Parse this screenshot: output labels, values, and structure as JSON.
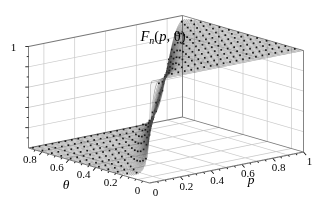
{
  "figure": {
    "background": "#ffffff",
    "kind": "3d-surface-plot"
  },
  "chart_data": {
    "type": "surface",
    "title_text": "F_n(p, θ)",
    "title_parts": {
      "func": "F",
      "sub": "n",
      "open": "(",
      "arg1": "p",
      "sep": ", ",
      "arg2": "θ",
      "close": ")"
    },
    "x_axis": {
      "label": "p",
      "range": [
        0,
        1
      ],
      "ticks": [
        0,
        0.2,
        0.4,
        0.6,
        0.8,
        1
      ],
      "tick_labels": [
        "0",
        "0.2",
        "0.4",
        "0.6",
        "0.8",
        "1"
      ],
      "minor_step": 0.05
    },
    "y_axis": {
      "label": "θ",
      "range": [
        0,
        0.9
      ],
      "ticks": [
        0,
        0.2,
        0.4,
        0.6,
        0.8
      ],
      "tick_labels": [
        "0",
        "0.2",
        "0.4",
        "0.6",
        "0.8"
      ],
      "minor_step": 0.05
    },
    "z_axis": {
      "label": "",
      "range": [
        0,
        1
      ],
      "ticks": [
        1
      ],
      "tick_labels": [
        "1"
      ],
      "minor_ticks": [
        0.2,
        0.4,
        0.6,
        0.8
      ]
    },
    "surface": {
      "description": "Distribution function F_n(p, θ): near 0 for p < θ, near 1 for p > θ, with a steep sigmoid transition along the diagonal p = θ (steeper for θ near 0); drawn as a fine mesh of constant-θ curves with black dotted sample rows on the surface",
      "model": {
        "n": 36,
        "logistic_k": 1.702,
        "s_floor": 0.004
      },
      "sample_grid": {
        "p": [
          0,
          0.1,
          0.2,
          0.3,
          0.4,
          0.5,
          0.6,
          0.7,
          0.8,
          0.9,
          1
        ],
        "theta": [
          0,
          0.1,
          0.2,
          0.3,
          0.4,
          0.5,
          0.6,
          0.7,
          0.8,
          0.9
        ],
        "F": [
          [
            0.5,
            1,
            1,
            1,
            1,
            1,
            1,
            1,
            1,
            1,
            1
          ],
          [
            0.04,
            0.5,
            0.96,
            1,
            1,
            1,
            1,
            1,
            1,
            1,
            1
          ],
          [
            0.01,
            0.08,
            0.5,
            0.92,
            0.99,
            1,
            1,
            1,
            1,
            1,
            1
          ],
          [
            0,
            0.01,
            0.11,
            0.5,
            0.89,
            0.99,
            1,
            1,
            1,
            1,
            1
          ],
          [
            0,
            0,
            0.02,
            0.12,
            0.5,
            0.88,
            0.98,
            1,
            1,
            1,
            1
          ],
          [
            0,
            0,
            0,
            0.02,
            0.12,
            0.5,
            0.88,
            0.98,
            1,
            1,
            1
          ],
          [
            0,
            0,
            0,
            0,
            0.02,
            0.12,
            0.5,
            0.88,
            0.98,
            1,
            1
          ],
          [
            0,
            0,
            0,
            0,
            0,
            0.01,
            0.11,
            0.5,
            0.89,
            0.99,
            1
          ],
          [
            0,
            0,
            0,
            0,
            0,
            0,
            0.01,
            0.08,
            0.5,
            0.92,
            0.99
          ],
          [
            0,
            0,
            0,
            0,
            0,
            0,
            0,
            0,
            0.04,
            0.5,
            0.96
          ]
        ]
      }
    },
    "style": {
      "dot_color": "#141414",
      "mesh_color": "rgba(70,70,70,0.5)",
      "fill_shade": "rgba(0,0,0,0.045)",
      "grid_color": "#c9c9c9",
      "edge_color": "#777777",
      "text_color": "#000000",
      "background": "#ffffff"
    },
    "render": {
      "slices": 52,
      "dot_theta_start": 0.04,
      "dot_theta_step": 0.07,
      "dot_theta_max": 0.88,
      "dot_dp": 0.042,
      "dot_size": 1.7,
      "face_grid_pt": [
        0.1,
        0.3,
        0.5,
        0.7,
        0.9
      ],
      "face_grid_z": [
        0.2,
        0.4,
        0.6,
        0.8
      ]
    },
    "legend": null,
    "grid": true
  }
}
